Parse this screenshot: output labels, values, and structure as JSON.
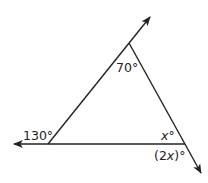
{
  "diagram": {
    "type": "triangle-with-extended-sides",
    "colors": {
      "line": "#222222",
      "text": "#222222",
      "background": "#ffffff"
    },
    "vertices": {
      "top": {
        "x": 129,
        "y": 43
      },
      "left": {
        "x": 48,
        "y": 144
      },
      "right": {
        "x": 185,
        "y": 144
      }
    },
    "rays": [
      {
        "name": "upper-ray",
        "from": "left",
        "through": "top",
        "tip": {
          "x": 151,
          "y": 16
        }
      },
      {
        "name": "left-ray",
        "from": "right",
        "through": "left",
        "tip": {
          "x": 13,
          "y": 144
        }
      },
      {
        "name": "lower-ray",
        "from": "top",
        "through": "right",
        "tip": {
          "x": 202,
          "y": 174
        }
      }
    ],
    "labels": {
      "top_angle": "70°",
      "left_exterior_angle": "130°",
      "right_interior_angle_var": "x",
      "right_interior_angle_deg": "°",
      "right_exterior_angle_open": "(2",
      "right_exterior_angle_var": "x",
      "right_exterior_angle_close": ")°"
    }
  }
}
